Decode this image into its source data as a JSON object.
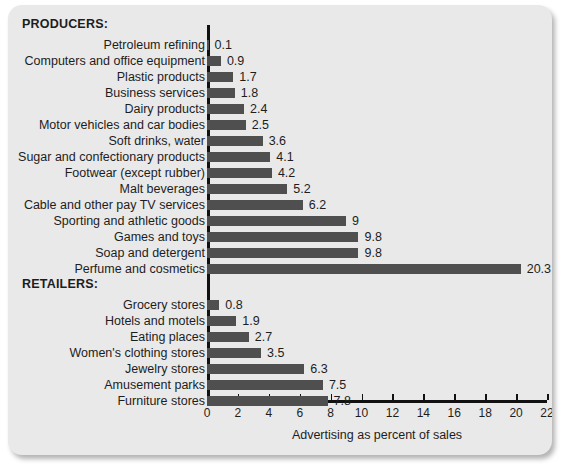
{
  "figure": {
    "background_color": "#e9e9e9",
    "bar_color": "#4f4f4f",
    "axis_color": "#111111",
    "text_color": "#1d1d1d"
  },
  "groups": [
    {
      "heading": "PRODUCERS:"
    },
    {
      "heading": "RETAILERS:"
    }
  ],
  "chart_data": {
    "type": "bar",
    "orientation": "horizontal",
    "title": "",
    "xlabel": "Advertising as percent of sales",
    "ylabel": "",
    "xlim": [
      0,
      22
    ],
    "xticks": [
      0,
      2,
      4,
      6,
      8,
      10,
      12,
      14,
      16,
      18,
      20,
      22
    ],
    "xtick_labels": [
      "0",
      "2",
      "4",
      "6",
      "8",
      "10",
      "12",
      "14",
      "16",
      "18",
      "20",
      "22"
    ],
    "grid": false,
    "legend": null,
    "value_labels": true,
    "groups": [
      {
        "name": "PRODUCERS:",
        "categories": [
          "Petroleum refining",
          "Computers and office equipment",
          "Plastic products",
          "Business services",
          "Dairy products",
          "Motor vehicles and car bodies",
          "Soft drinks, water",
          "Sugar and confectionary products",
          "Footwear (except rubber)",
          "Malt beverages",
          "Cable and other pay TV services",
          "Sporting and athletic goods",
          "Games and toys",
          "Soap and detergent",
          "Perfume and cosmetics"
        ],
        "values": [
          0.1,
          0.9,
          1.7,
          1.8,
          2.4,
          2.5,
          3.6,
          4.1,
          4.2,
          5.2,
          6.2,
          9,
          9.8,
          9.8,
          20.3
        ],
        "value_text": [
          "0.1",
          "0.9",
          "1.7",
          "1.8",
          "2.4",
          "2.5",
          "3.6",
          "4.1",
          "4.2",
          "5.2",
          "6.2",
          "9",
          "9.8",
          "9.8",
          "20.3"
        ]
      },
      {
        "name": "RETAILERS:",
        "categories": [
          "Grocery stores",
          "Hotels and motels",
          "Eating places",
          "Women's clothing stores",
          "Jewelry stores",
          "Amusement parks",
          "Furniture stores"
        ],
        "values": [
          0.8,
          1.9,
          2.7,
          3.5,
          6.3,
          7.5,
          7.8
        ],
        "value_text": [
          "0.8",
          "1.9",
          "2.7",
          "3.5",
          "6.3",
          "7.5",
          "7.8"
        ]
      }
    ]
  }
}
